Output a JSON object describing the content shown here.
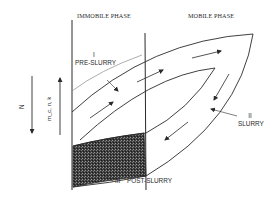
{
  "diagram": {
    "headers": {
      "immobile_phase": "IMMOBILE PHASE",
      "mobile_phase": "MOBILE PHASE"
    },
    "regions": {
      "pre_slurry": {
        "numeral": "I",
        "label": "PRE-SLURRY"
      },
      "slurry": {
        "numeral": "II",
        "label": "SLURRY"
      },
      "post_slurry": {
        "numeral": "III",
        "label": "POST-SLURRY"
      }
    },
    "axes": {
      "left_arrow": {
        "label": "N",
        "direction": "down"
      },
      "right_arrow": {
        "label": "m_c, n, k",
        "direction": "up"
      }
    },
    "colors": {
      "line": "#2a2a2a",
      "light_line": "#8a8a8a",
      "shaded": "#3a3a3a",
      "background": "#ffffff"
    }
  }
}
